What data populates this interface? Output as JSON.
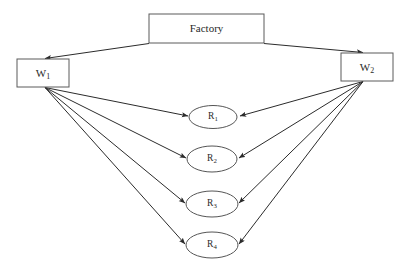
{
  "diagram": {
    "background_color": "#ffffff",
    "line_color": "#2b2b2b",
    "box_stroke_color": "#5a5a5a",
    "ellipse_stroke_color": "#555555",
    "nodes": {
      "factory": {
        "label": "Factory",
        "shape": "rectangle",
        "x": 149,
        "y": 14,
        "w": 115,
        "h": 29
      },
      "warehouse_1": {
        "label": "W",
        "subscript": "1",
        "full_label": "W1",
        "shape": "rectangle",
        "x": 17,
        "y": 59,
        "w": 52,
        "h": 28
      },
      "warehouse_2": {
        "label": "W",
        "subscript": "2",
        "full_label": "W2",
        "shape": "rectangle",
        "x": 341,
        "y": 53,
        "w": 52,
        "h": 28
      },
      "retailers": [
        {
          "label": "R",
          "subscript": "1",
          "full_label": "R1",
          "shape": "ellipse",
          "cx": 213,
          "cy": 117,
          "rx": 24,
          "ry": 11.5
        },
        {
          "label": "R",
          "subscript": "2",
          "full_label": "R2",
          "shape": "ellipse",
          "cx": 212,
          "cy": 159,
          "rx": 25,
          "ry": 13
        },
        {
          "label": "R",
          "subscript": "3",
          "full_label": "R3",
          "shape": "ellipse",
          "cx": 212,
          "cy": 204,
          "rx": 26,
          "ry": 13
        },
        {
          "label": "R",
          "subscript": "4",
          "full_label": "R4",
          "shape": "ellipse",
          "cx": 212,
          "cy": 245,
          "rx": 26,
          "ry": 13
        }
      ]
    },
    "edges": [
      {
        "from": "factory",
        "to": "warehouse_1",
        "arrow": "to"
      },
      {
        "from": "factory",
        "to": "warehouse_2",
        "arrow": "to"
      },
      {
        "from": "warehouse_1",
        "to": "retailer_1",
        "arrow": "to"
      },
      {
        "from": "warehouse_1",
        "to": "retailer_2",
        "arrow": "to"
      },
      {
        "from": "warehouse_1",
        "to": "retailer_3",
        "arrow": "to"
      },
      {
        "from": "warehouse_1",
        "to": "retailer_4",
        "arrow": "to"
      },
      {
        "from": "warehouse_2",
        "to": "retailer_1",
        "arrow": "to"
      },
      {
        "from": "warehouse_2",
        "to": "retailer_2",
        "arrow": "to"
      },
      {
        "from": "warehouse_2",
        "to": "retailer_3",
        "arrow": "to"
      },
      {
        "from": "warehouse_2",
        "to": "retailer_4",
        "arrow": "to"
      }
    ]
  }
}
